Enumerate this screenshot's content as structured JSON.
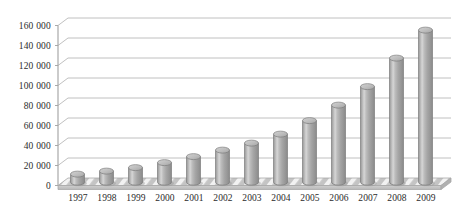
{
  "chart_data": {
    "type": "bar",
    "title": "",
    "subtitle": "",
    "xlabel": "",
    "ylabel": "",
    "categories": [
      "1997",
      "1998",
      "1999",
      "2000",
      "2001",
      "2002",
      "2003",
      "2004",
      "2005",
      "2006",
      "2007",
      "2008",
      "2009"
    ],
    "values": [
      8000,
      11000,
      14500,
      19500,
      25500,
      32000,
      39000,
      48000,
      61500,
      77000,
      95500,
      124000,
      152000
    ],
    "series": [
      {
        "name": "",
        "values": [
          8000,
          11000,
          14500,
          19500,
          25500,
          32000,
          39000,
          48000,
          61500,
          77000,
          95500,
          124000,
          152000
        ]
      }
    ],
    "ylim": [
      0,
      160000
    ],
    "ytick_values": [
      0,
      20000,
      40000,
      60000,
      80000,
      100000,
      120000,
      140000,
      160000
    ],
    "ytick_labels": [
      "0",
      "20 000",
      "40 000",
      "60 000",
      "80 000",
      "100 000",
      "120 000",
      "140 000",
      "160 000"
    ],
    "grid": true,
    "grid_axis": "y",
    "legend": false,
    "legend_position": "none",
    "bar_style": "cylinder-3d",
    "annotations": []
  },
  "style": {
    "background_color": "#ffffff",
    "bar_color": "#a9a9a9",
    "bar_highlight_color": "#d9d9d9",
    "bar_shadow_color": "#8a8a8a",
    "bar_outline_color": "#7d7d7d",
    "grid_color": "#b9b9b9",
    "axis_color": "#a0a0a0",
    "text_color": "#2b2b2b",
    "floor_color": "#c9c9c9",
    "floor_hatch_color": "#ffffff"
  },
  "axes": {
    "y_axis_name": "value-axis",
    "x_axis_name": "category-axis"
  }
}
